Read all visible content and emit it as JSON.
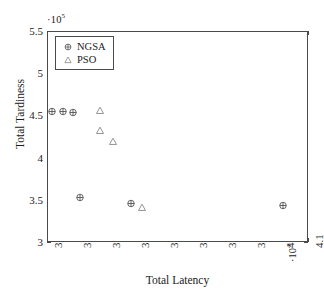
{
  "chart_data": {
    "type": "scatter",
    "title": "",
    "xlabel": "Total Latency",
    "ylabel": "Total Tardiness",
    "x_exponent_label": "·10",
    "x_exponent_sup": "4",
    "y_exponent_label": "·10",
    "y_exponent_sup": "5",
    "xlim": [
      3.2,
      4.1
    ],
    "ylim": [
      3.0,
      5.5
    ],
    "grid": false,
    "legend_position": "top-left",
    "x_ticks": [
      "3.2",
      "3.3",
      "3.4",
      "3.5",
      "3.6",
      "3.7",
      "3.8",
      "3.9",
      "4",
      "4.1"
    ],
    "x_tick_values": [
      3.2,
      3.3,
      3.4,
      3.5,
      3.6,
      3.7,
      3.8,
      3.9,
      4.0,
      4.1
    ],
    "y_ticks": [
      "3",
      "3.5",
      "4",
      "4.5",
      "5",
      "5.5"
    ],
    "y_tick_values": [
      3,
      3.5,
      4,
      4.5,
      5,
      5.5
    ],
    "series": [
      {
        "name": "NGSA",
        "marker": "circle-plus",
        "color": "#555555",
        "points": [
          {
            "x": 3.215,
            "y": 4.56
          },
          {
            "x": 3.25,
            "y": 4.56
          },
          {
            "x": 3.285,
            "y": 4.555
          },
          {
            "x": 3.31,
            "y": 3.545
          },
          {
            "x": 3.485,
            "y": 3.475
          },
          {
            "x": 4.01,
            "y": 3.445
          }
        ]
      },
      {
        "name": "PSO",
        "marker": "triangle-up",
        "color": "#888888",
        "points": [
          {
            "x": 3.38,
            "y": 4.57
          },
          {
            "x": 3.38,
            "y": 4.34
          },
          {
            "x": 3.425,
            "y": 4.205
          },
          {
            "x": 3.525,
            "y": 3.43
          }
        ]
      }
    ]
  },
  "legend": {
    "items": [
      {
        "label": "NGSA",
        "marker": "circle-plus"
      },
      {
        "label": "PSO",
        "marker": "triangle-up"
      }
    ]
  }
}
